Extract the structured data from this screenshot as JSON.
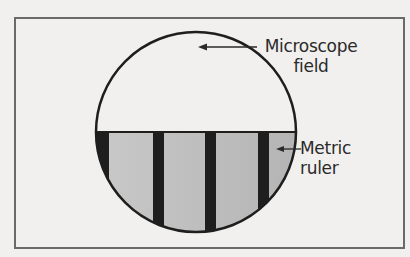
{
  "diagram": {
    "labels": {
      "microscope_field": [
        "Microscope",
        "field"
      ],
      "metric_ruler": [
        "Metric",
        "ruler"
      ]
    },
    "colors": {
      "background": "#f1f0ee",
      "frame": "#6a6a6a",
      "outline": "#1e1e1e",
      "ruler_bar": "#1e1e1e",
      "ruler_fill": "#bdbdbd"
    }
  }
}
